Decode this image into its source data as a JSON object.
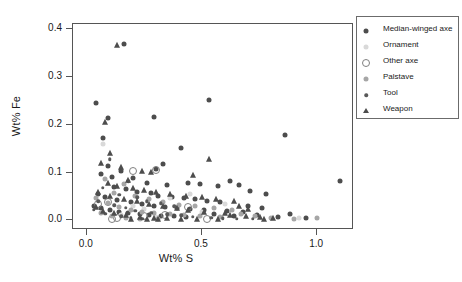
{
  "chart_data": {
    "type": "scatter",
    "title": "",
    "xlabel": "Wt% S",
    "ylabel": "Wt% Fe",
    "xlim": [
      -0.06,
      1.16
    ],
    "ylim": [
      -0.02,
      0.41
    ],
    "xticks": [
      "0.0",
      "0.5",
      "1.0"
    ],
    "xtick_values": [
      0.0,
      0.5,
      1.0
    ],
    "yticks": [
      "0.0",
      "0.1",
      "0.2",
      "0.3",
      "0.4"
    ],
    "ytick_values": [
      0.0,
      0.1,
      0.2,
      0.3,
      0.4
    ],
    "grid": false,
    "legend_position": "right",
    "series": [
      {
        "name": "Median-winged axe",
        "marker": "filled-circle",
        "color": "#4d4d4d",
        "size": 5,
        "points": [
          [
            0.16,
            0.368
          ],
          [
            0.04,
            0.245
          ],
          [
            0.09,
            0.213
          ],
          [
            0.29,
            0.216
          ],
          [
            0.07,
            0.172
          ],
          [
            0.53,
            0.252
          ],
          [
            0.86,
            0.178
          ],
          [
            1.1,
            0.082
          ],
          [
            0.41,
            0.152
          ],
          [
            0.33,
            0.118
          ],
          [
            0.3,
            0.107
          ],
          [
            0.15,
            0.104
          ],
          [
            0.09,
            0.113
          ],
          [
            0.06,
            0.097
          ],
          [
            0.11,
            0.091
          ],
          [
            0.2,
            0.088
          ],
          [
            0.26,
            0.079
          ],
          [
            0.35,
            0.074
          ],
          [
            0.44,
            0.078
          ],
          [
            0.49,
            0.076
          ],
          [
            0.57,
            0.071
          ],
          [
            0.62,
            0.082
          ],
          [
            0.66,
            0.073
          ],
          [
            0.71,
            0.062
          ],
          [
            0.78,
            0.056
          ],
          [
            0.12,
            0.07
          ],
          [
            0.17,
            0.065
          ],
          [
            0.22,
            0.06
          ],
          [
            0.28,
            0.058
          ],
          [
            0.31,
            0.052
          ],
          [
            0.37,
            0.049
          ],
          [
            0.42,
            0.046
          ],
          [
            0.47,
            0.044
          ],
          [
            0.52,
            0.04
          ],
          [
            0.58,
            0.038
          ],
          [
            0.05,
            0.055
          ],
          [
            0.08,
            0.048
          ],
          [
            0.13,
            0.042
          ],
          [
            0.19,
            0.038
          ],
          [
            0.24,
            0.034
          ],
          [
            0.29,
            0.03
          ],
          [
            0.34,
            0.028
          ],
          [
            0.39,
            0.026
          ],
          [
            0.45,
            0.024
          ],
          [
            0.51,
            0.022
          ],
          [
            0.03,
            0.03
          ],
          [
            0.06,
            0.026
          ],
          [
            0.1,
            0.022
          ],
          [
            0.14,
            0.018
          ],
          [
            0.18,
            0.016
          ],
          [
            0.23,
            0.014
          ],
          [
            0.27,
            0.012
          ],
          [
            0.32,
            0.01
          ],
          [
            0.38,
            0.009
          ],
          [
            0.43,
            0.008
          ],
          [
            0.61,
            0.02
          ],
          [
            0.68,
            0.018
          ],
          [
            0.74,
            0.012
          ],
          [
            0.83,
            0.008
          ],
          [
            0.95,
            0.006
          ],
          [
            0.55,
            0.014
          ],
          [
            0.64,
            0.01
          ],
          [
            0.7,
            0.03
          ],
          [
            0.76,
            0.026
          ],
          [
            0.88,
            0.014
          ]
        ]
      },
      {
        "name": "Ornament",
        "marker": "filled-circle",
        "color": "#d9d9d9",
        "size": 5,
        "points": [
          [
            0.07,
            0.16
          ],
          [
            0.36,
            0.046
          ],
          [
            0.45,
            0.056
          ],
          [
            0.2,
            0.03
          ],
          [
            0.25,
            0.024
          ],
          [
            0.6,
            0.034
          ],
          [
            0.5,
            0.018
          ],
          [
            0.15,
            0.012
          ],
          [
            0.92,
            0.006
          ],
          [
            0.3,
            0.008
          ]
        ]
      },
      {
        "name": "Other axe",
        "marker": "open-circle",
        "color": "#808080",
        "size": 6,
        "points": [
          [
            0.05,
            0.034
          ],
          [
            0.11,
            0.002
          ],
          [
            0.2,
            0.104
          ],
          [
            0.3,
            0.106
          ],
          [
            0.44,
            0.028
          ],
          [
            0.25,
            0.01
          ],
          [
            0.13,
            0.006
          ],
          [
            0.52,
            0.004
          ],
          [
            0.09,
            0.038
          ],
          [
            0.34,
            0.012
          ]
        ]
      },
      {
        "name": "Palstave",
        "marker": "filled-circle",
        "color": "#a6a6a6",
        "size": 5,
        "points": [
          [
            0.08,
            0.086
          ],
          [
            0.16,
            0.076
          ],
          [
            0.12,
            0.058
          ],
          [
            0.21,
            0.05
          ],
          [
            0.27,
            0.044
          ],
          [
            0.33,
            0.038
          ],
          [
            0.4,
            0.032
          ],
          [
            0.47,
            0.03
          ],
          [
            0.55,
            0.026
          ],
          [
            0.63,
            0.022
          ],
          [
            0.04,
            0.046
          ],
          [
            0.09,
            0.036
          ],
          [
            0.14,
            0.028
          ],
          [
            0.19,
            0.022
          ],
          [
            0.24,
            0.018
          ],
          [
            0.29,
            0.016
          ],
          [
            0.36,
            0.014
          ],
          [
            0.42,
            0.012
          ],
          [
            0.49,
            0.01
          ],
          [
            0.58,
            0.008
          ],
          [
            0.06,
            0.016
          ],
          [
            0.11,
            0.01
          ],
          [
            0.17,
            0.006
          ],
          [
            0.23,
            0.004
          ],
          [
            0.31,
            0.003
          ],
          [
            0.67,
            0.014
          ],
          [
            0.73,
            0.01
          ],
          [
            0.8,
            0.006
          ],
          [
            1.0,
            0.005
          ],
          [
            0.9,
            0.004
          ]
        ]
      },
      {
        "name": "Tool",
        "marker": "filled-circle",
        "color": "#595959",
        "size": 3.5,
        "points": [
          [
            0.1,
            0.128
          ],
          [
            0.18,
            0.082
          ],
          [
            0.07,
            0.068
          ],
          [
            0.14,
            0.054
          ],
          [
            0.22,
            0.048
          ],
          [
            0.26,
            0.04
          ],
          [
            0.32,
            0.036
          ],
          [
            0.38,
            0.03
          ],
          [
            0.05,
            0.04
          ],
          [
            0.12,
            0.032
          ],
          [
            0.17,
            0.026
          ],
          [
            0.21,
            0.02
          ],
          [
            0.28,
            0.016
          ],
          [
            0.35,
            0.013
          ],
          [
            0.41,
            0.011
          ],
          [
            0.03,
            0.022
          ],
          [
            0.08,
            0.014
          ],
          [
            0.15,
            0.009
          ],
          [
            0.19,
            0.006
          ],
          [
            0.24,
            0.004
          ],
          [
            0.46,
            0.008
          ],
          [
            0.54,
            0.006
          ],
          [
            0.59,
            0.005
          ],
          [
            0.65,
            0.004
          ],
          [
            0.72,
            0.003
          ]
        ]
      },
      {
        "name": "Weapon",
        "marker": "filled-triangle",
        "color": "#4d4d4d",
        "size": 4,
        "points": [
          [
            0.13,
            0.366
          ],
          [
            0.08,
            0.205
          ],
          [
            0.53,
            0.128
          ],
          [
            0.1,
            0.14
          ],
          [
            0.06,
            0.12
          ],
          [
            0.15,
            0.112
          ],
          [
            0.24,
            0.103
          ],
          [
            0.28,
            0.102
          ],
          [
            0.46,
            0.094
          ],
          [
            0.18,
            0.084
          ],
          [
            0.09,
            0.078
          ],
          [
            0.13,
            0.072
          ],
          [
            0.2,
            0.068
          ],
          [
            0.25,
            0.064
          ],
          [
            0.3,
            0.06
          ],
          [
            0.36,
            0.056
          ],
          [
            0.43,
            0.052
          ],
          [
            0.5,
            0.048
          ],
          [
            0.56,
            0.044
          ],
          [
            0.64,
            0.04
          ],
          [
            0.05,
            0.06
          ],
          [
            0.1,
            0.05
          ],
          [
            0.16,
            0.044
          ],
          [
            0.22,
            0.04
          ],
          [
            0.27,
            0.034
          ],
          [
            0.33,
            0.03
          ],
          [
            0.39,
            0.026
          ],
          [
            0.44,
            0.022
          ],
          [
            0.51,
            0.018
          ],
          [
            0.6,
            0.016
          ],
          [
            0.04,
            0.028
          ],
          [
            0.07,
            0.02
          ],
          [
            0.12,
            0.015
          ],
          [
            0.17,
            0.011
          ],
          [
            0.23,
            0.008
          ],
          [
            0.29,
            0.006
          ],
          [
            0.35,
            0.005
          ],
          [
            0.41,
            0.004
          ],
          [
            0.48,
            0.004
          ],
          [
            0.57,
            0.003
          ],
          [
            0.62,
            0.012
          ],
          [
            0.69,
            0.01
          ],
          [
            0.75,
            0.008
          ],
          [
            0.81,
            0.006
          ],
          [
            0.66,
            0.03
          ],
          [
            0.7,
            0.024
          ],
          [
            0.77,
            0.004
          ],
          [
            0.31,
            0.002
          ],
          [
            0.19,
            0.002
          ],
          [
            0.26,
            0.002
          ]
        ]
      }
    ]
  },
  "legend": {
    "entries": [
      {
        "label": "Median-winged axe"
      },
      {
        "label": "Ornament"
      },
      {
        "label": "Other axe"
      },
      {
        "label": "Palstave"
      },
      {
        "label": "Tool"
      },
      {
        "label": "Weapon"
      }
    ]
  }
}
